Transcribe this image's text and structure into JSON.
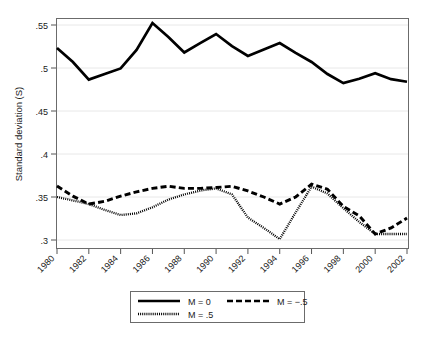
{
  "chart_data": {
    "type": "line",
    "title": "",
    "xlabel": "",
    "ylabel": "Standard deviation (S)",
    "x": [
      1980,
      1981,
      1982,
      1983,
      1984,
      1985,
      1986,
      1987,
      1988,
      1989,
      1990,
      1991,
      1992,
      1993,
      1994,
      1995,
      1996,
      1997,
      1998,
      1999,
      2000,
      2001,
      2002
    ],
    "xtick_labels": [
      "1980",
      "1982",
      "1984",
      "1986",
      "1988",
      "1990",
      "1992",
      "1994",
      "1996",
      "1998",
      "2000",
      "2002"
    ],
    "xticks": [
      1980,
      1982,
      1984,
      1986,
      1988,
      1990,
      1992,
      1994,
      1996,
      1998,
      2000,
      2002
    ],
    "xlim": [
      1979.5,
      2002.6
    ],
    "ytick_labels": [
      ".55",
      ".5",
      ".45",
      ".4",
      ".35",
      ".3"
    ],
    "yticks": [
      0.55,
      0.5,
      0.45,
      0.4,
      0.35,
      0.3
    ],
    "ylim": [
      0.291,
      0.559
    ],
    "grid": "horizontal",
    "legend_position": "below-axis",
    "series": [
      {
        "name": "M = 0",
        "style": "solid",
        "color": "#000000",
        "values": [
          0.5233,
          0.507,
          0.4865,
          0.493,
          0.4995,
          0.521,
          0.5523,
          0.536,
          0.518,
          0.529,
          0.5395,
          0.5255,
          0.514,
          0.5215,
          0.529,
          0.5175,
          0.507,
          0.493,
          0.4825,
          0.4875,
          0.494,
          0.487,
          0.484
        ]
      },
      {
        "name": "M = -.5",
        "style": "dashed",
        "color": "#000000",
        "values": [
          0.3627,
          0.351,
          0.3418,
          0.345,
          0.351,
          0.356,
          0.36,
          0.3625,
          0.36,
          0.36,
          0.361,
          0.3625,
          0.357,
          0.35,
          0.3418,
          0.35,
          0.365,
          0.359,
          0.339,
          0.328,
          0.307,
          0.314,
          0.3255
        ]
      },
      {
        "name": "M = .5",
        "style": "dotted",
        "color": "#8c8c8c",
        "values": [
          0.35,
          0.346,
          0.3418,
          0.335,
          0.329,
          0.331,
          0.338,
          0.347,
          0.353,
          0.3575,
          0.36,
          0.353,
          0.326,
          0.314,
          0.301,
          0.332,
          0.362,
          0.354,
          0.337,
          0.321,
          0.307,
          0.307,
          0.307
        ]
      }
    ]
  },
  "legend": {
    "entries": [
      {
        "label": "M = 0",
        "style": "solid"
      },
      {
        "label": "M = −.5",
        "style": "dashed"
      },
      {
        "label": "M = .5",
        "style": "dotted"
      }
    ]
  },
  "axes": {
    "y_title": "Standard deviation (S)"
  }
}
